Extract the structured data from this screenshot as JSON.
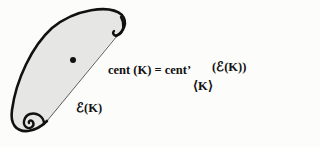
{
  "diagram": {
    "shape": {
      "name": "convex body K",
      "fill": "#e6e6e4",
      "stroke": "#111111"
    },
    "center_point": {
      "x": 73,
      "y": 60
    },
    "equation": {
      "lhs": "cent (K) = cent’",
      "subscript": "⟨K⟩",
      "argument": "(ℰ(K))"
    },
    "set_label": "ℰ(K)"
  }
}
